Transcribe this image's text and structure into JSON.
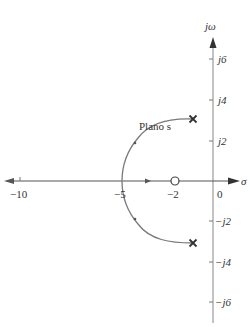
{
  "diagram": {
    "title": "Plano s",
    "type": "root-locus",
    "axes": {
      "real_label": "σ",
      "imag_label": "jω",
      "real_ticks": [
        "−10",
        "−5",
        "−2",
        "0"
      ],
      "imag_ticks": [
        "j6",
        "j4",
        "j2",
        "−j2",
        "−j4",
        "−j6"
      ]
    },
    "poles": [
      {
        "re": -1,
        "im": 3
      },
      {
        "re": -1,
        "im": -3
      }
    ],
    "zeros": [
      {
        "re": -2,
        "im": 0
      }
    ],
    "breakin_point": -5,
    "colors": {
      "axis": "#9a9a9a",
      "locus": "#7a7a7a",
      "marker": "#333333",
      "text": "#333333"
    }
  }
}
